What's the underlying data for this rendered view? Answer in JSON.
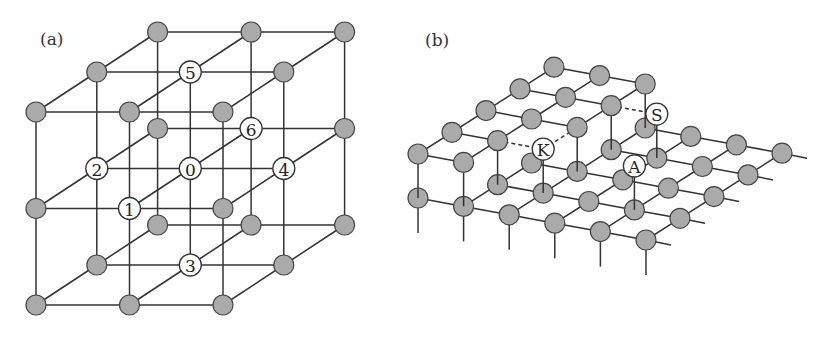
{
  "figure": {
    "panels": [
      {
        "id": "a",
        "label": "(a)",
        "description": "Simple cubic lattice 3x3x3",
        "lattice_size": [
          3,
          3,
          3
        ],
        "labeled_sites": [
          {
            "label": "0",
            "site": [
              1,
              1,
              1
            ]
          },
          {
            "label": "1",
            "site": [
              1,
              1,
              0
            ]
          },
          {
            "label": "2",
            "site": [
              0,
              1,
              1
            ]
          },
          {
            "label": "3",
            "site": [
              1,
              2,
              1
            ]
          },
          {
            "label": "4",
            "site": [
              2,
              1,
              1
            ]
          },
          {
            "label": "5",
            "site": [
              1,
              0,
              1
            ]
          },
          {
            "label": "6",
            "site": [
              1,
              1,
              2
            ]
          }
        ]
      },
      {
        "id": "b",
        "label": "(b)",
        "description": "Crystal surface with terrace, step, kink and adatom",
        "lower_layer_rows": [
          {
            "row": 0,
            "from": 0,
            "to": 5
          },
          {
            "row": 1,
            "from": 1,
            "to": 5
          },
          {
            "row": 2,
            "from": 1,
            "to": 5
          },
          {
            "row": 3,
            "from": 2,
            "to": 5
          },
          {
            "row": 4,
            "from": 2,
            "to": 5
          }
        ],
        "upper_layer_sites": [
          [
            0,
            0
          ],
          [
            1,
            0
          ],
          [
            0,
            1
          ],
          [
            1,
            1
          ],
          [
            0,
            2
          ],
          [
            1,
            2
          ],
          [
            2,
            2
          ],
          [
            0,
            3
          ],
          [
            1,
            3
          ],
          [
            2,
            3
          ],
          [
            0,
            4
          ],
          [
            1,
            4
          ],
          [
            2,
            4
          ]
        ],
        "labeled_sites": [
          {
            "label": "K",
            "name": "kink",
            "site": [
              2,
              1
            ],
            "level": "upper"
          },
          {
            "label": "S",
            "name": "step",
            "site": [
              3,
              3
            ],
            "level": "upper"
          },
          {
            "label": "A",
            "name": "adatom",
            "site": [
              4,
              1
            ],
            "level": "upper"
          }
        ]
      }
    ]
  },
  "colors": {
    "atom_fill": "#aaaaaa",
    "atom_stroke": "#444444",
    "bond": "#333333",
    "labeled_fill": "#ffffff"
  }
}
